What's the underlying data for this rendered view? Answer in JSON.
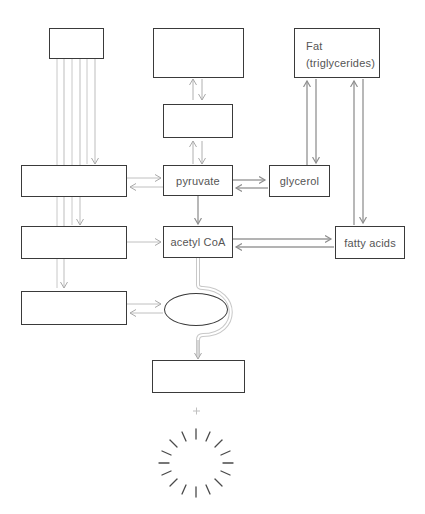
{
  "diagram": {
    "title": "",
    "type": "metabolic-pathway",
    "colors": {
      "box_border": "#3a3a3a",
      "arrow_light": "#bdbdbd",
      "arrow_dark": "#9a9a9a",
      "text": "#555555"
    },
    "nodes": {
      "top_left_blank": {
        "label": ""
      },
      "top_center_blank": {
        "label": ""
      },
      "mid_center_blank": {
        "label": ""
      },
      "fat": {
        "line1": "Fat",
        "line2": "(triglycerides)"
      },
      "left_blank_1": {
        "label": ""
      },
      "pyruvate": {
        "label": "pyruvate"
      },
      "glycerol": {
        "label": "glycerol"
      },
      "left_blank_2": {
        "label": ""
      },
      "acetyl_coa": {
        "label": "acetyl CoA"
      },
      "fatty_acids": {
        "label": "fatty acids"
      },
      "left_blank_3": {
        "label": ""
      },
      "cycle_ellipse": {
        "label": ""
      },
      "bottom_blank": {
        "label": ""
      }
    },
    "symbols": {
      "plus": "+",
      "energy_burst": "radiating-lines"
    }
  }
}
